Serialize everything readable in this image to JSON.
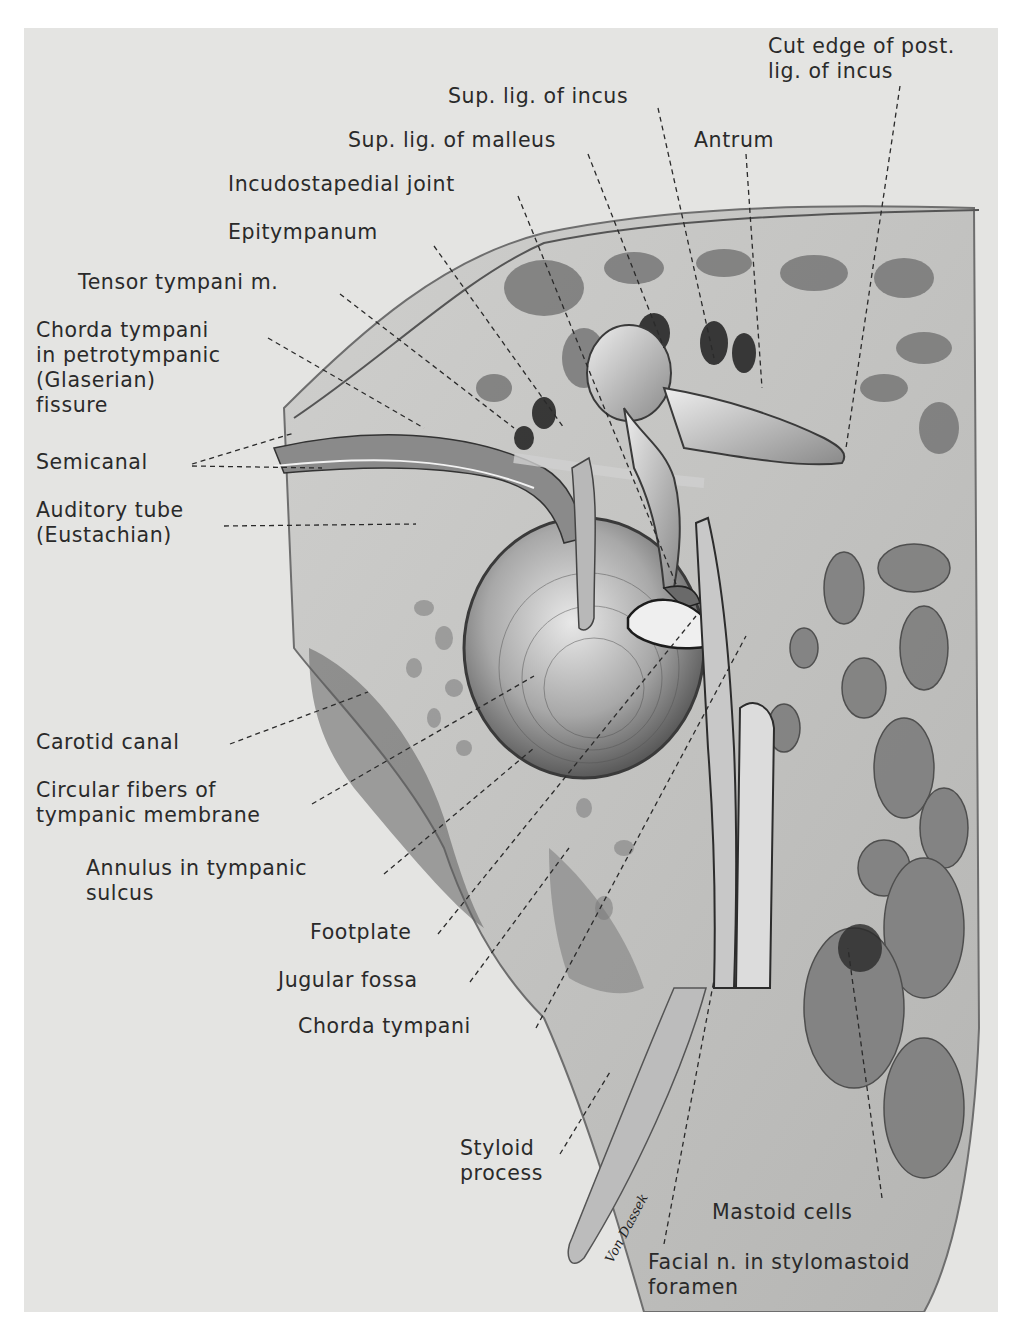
{
  "figure": {
    "signature": "Von Dassek",
    "plate_color": "#e4e4e2",
    "ink_color": "#2a2a2a"
  },
  "labels": [
    {
      "id": "cut-edge-post-lig-incus",
      "text": "Cut edge of post.\nlig. of incus",
      "x": 744,
      "y": 6,
      "leader": [
        [
          876,
          58
        ],
        [
          822,
          420
        ]
      ]
    },
    {
      "id": "sup-lig-incus",
      "text": "Sup. lig. of incus",
      "x": 424,
      "y": 56,
      "leader": [
        [
          634,
          80
        ],
        [
          690,
          330
        ]
      ]
    },
    {
      "id": "antrum",
      "text": "Antrum",
      "x": 670,
      "y": 100,
      "leader": [
        [
          722,
          126
        ],
        [
          738,
          360
        ]
      ]
    },
    {
      "id": "sup-lig-malleus",
      "text": "Sup. lig. of malleus",
      "x": 324,
      "y": 100,
      "leader": [
        [
          564,
          126
        ],
        [
          640,
          320
        ]
      ]
    },
    {
      "id": "incudostapedial-joint",
      "text": "Incudostapedial joint",
      "x": 204,
      "y": 144,
      "leader": [
        [
          494,
          168
        ],
        [
          652,
          556
        ]
      ]
    },
    {
      "id": "epitympanum",
      "text": "Epitympanum",
      "x": 204,
      "y": 192,
      "leader": [
        [
          410,
          218
        ],
        [
          540,
          400
        ]
      ]
    },
    {
      "id": "tensor-tympani",
      "text": "Tensor tympani m.",
      "x": 54,
      "y": 242,
      "leader": [
        [
          316,
          266
        ],
        [
          490,
          400
        ]
      ]
    },
    {
      "id": "chorda-tympani-petrotympanic",
      "text": "Chorda tympani\nin petrotympanic\n(Glaserian)\nfissure",
      "x": 12,
      "y": 290,
      "leader": [
        [
          244,
          310
        ],
        [
          400,
          400
        ]
      ]
    },
    {
      "id": "semicanal",
      "text": "Semicanal",
      "x": 12,
      "y": 422,
      "leader": [
        [
          168,
          436
        ],
        [
          270,
          405
        ]
      ],
      "leader2": [
        [
          168,
          438
        ],
        [
          298,
          440
        ]
      ]
    },
    {
      "id": "auditory-tube",
      "text": "Auditory tube\n(Eustachian)",
      "x": 12,
      "y": 470,
      "leader": [
        [
          200,
          498
        ],
        [
          392,
          496
        ]
      ]
    },
    {
      "id": "carotid-canal",
      "text": "Carotid canal",
      "x": 12,
      "y": 702,
      "leader": [
        [
          206,
          716
        ],
        [
          344,
          664
        ]
      ]
    },
    {
      "id": "circular-fibers",
      "text": "Circular fibers of\ntympanic membrane",
      "x": 12,
      "y": 750,
      "leader": [
        [
          288,
          776
        ],
        [
          510,
          648
        ]
      ]
    },
    {
      "id": "annulus",
      "text": "Annulus in tympanic\nsulcus",
      "x": 62,
      "y": 828,
      "leader": [
        [
          360,
          846
        ],
        [
          510,
          720
        ]
      ]
    },
    {
      "id": "footplate",
      "text": "Footplate",
      "x": 286,
      "y": 892,
      "leader": [
        [
          414,
          906
        ],
        [
          672,
          588
        ]
      ]
    },
    {
      "id": "jugular-fossa",
      "text": "Jugular fossa",
      "x": 254,
      "y": 940,
      "leader": [
        [
          446,
          954
        ],
        [
          545,
          820
        ]
      ]
    },
    {
      "id": "chorda-tympani",
      "text": "Chorda tympani",
      "x": 274,
      "y": 986,
      "leader": [
        [
          512,
          1000
        ],
        [
          722,
          608
        ]
      ]
    },
    {
      "id": "styloid-process",
      "text": "Styloid\nprocess",
      "x": 436,
      "y": 1108,
      "leader": [
        [
          536,
          1126
        ],
        [
          586,
          1044
        ]
      ]
    },
    {
      "id": "mastoid-cells",
      "text": "Mastoid cells",
      "x": 688,
      "y": 1172,
      "leader": [
        [
          858,
          1170
        ],
        [
          824,
          920
        ]
      ]
    },
    {
      "id": "facial-n-stylomastoid",
      "text": "Facial n. in stylomastoid\nforamen",
      "x": 624,
      "y": 1222,
      "leader": [
        [
          640,
          1216
        ],
        [
          690,
          952
        ]
      ]
    }
  ]
}
